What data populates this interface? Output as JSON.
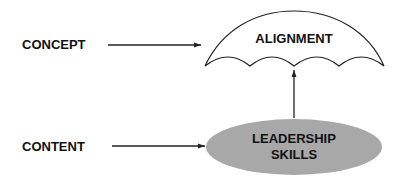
{
  "labels": {
    "concept": "CONCEPT",
    "content": "CONTENT",
    "umbrella": "ALIGNMENT",
    "ellipse_line1": "LEADERSHIP",
    "ellipse_line2": "SKILLS"
  },
  "colors": {
    "ellipse_fill": "#a8a8a8",
    "stroke": "#222222",
    "text": "#111111"
  }
}
